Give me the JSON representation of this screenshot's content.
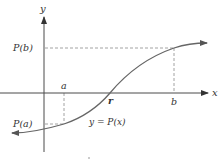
{
  "diagram": {
    "type": "function-graph",
    "colors": {
      "axis": "#4a4a4a",
      "curve": "#6a6a6a",
      "dashed": "#8a8a8a",
      "text": "#333333",
      "background": "#ffffff"
    },
    "axes": {
      "x_label": "x",
      "y_label": "y"
    },
    "labels": {
      "a": "a",
      "b": "b",
      "r": "r",
      "P_a": "P(a)",
      "P_b": "P(b)",
      "curve": "y = P(x)"
    },
    "points": {
      "a": {
        "x": 64,
        "y": 93
      },
      "b": {
        "x": 174,
        "y": 93
      },
      "r": {
        "x": 110,
        "y": 93
      },
      "P_a": {
        "x": 64,
        "y": 124
      },
      "P_b": {
        "x": 174,
        "y": 48
      }
    }
  }
}
